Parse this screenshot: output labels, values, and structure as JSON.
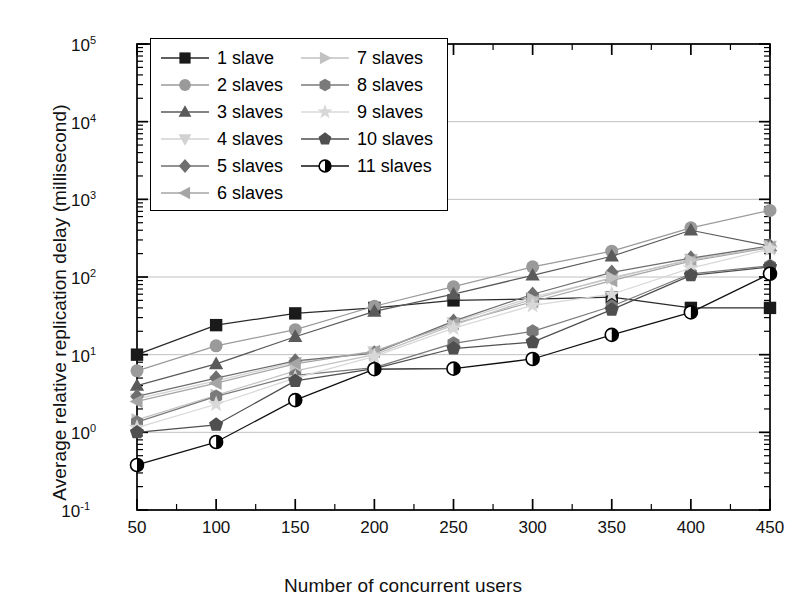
{
  "chart_data": {
    "type": "line",
    "title": "",
    "xlabel": "Number of concurrent users",
    "ylabel": "Average relative replication delay (millisecond)",
    "x": [
      50,
      100,
      150,
      200,
      250,
      300,
      350,
      400,
      450
    ],
    "xlim": [
      50,
      450
    ],
    "ylim": [
      0.1,
      100000
    ],
    "yscale": "log",
    "xticklabels": [
      "50",
      "100",
      "150",
      "200",
      "250",
      "300",
      "350",
      "400",
      "450"
    ],
    "yticklabels": [
      "10-1",
      "100",
      "101",
      "102",
      "103",
      "104",
      "105"
    ],
    "ytick_bases": [
      "10",
      "10",
      "10",
      "10",
      "10",
      "10",
      "10"
    ],
    "ytick_exps": [
      "-1",
      "0",
      "1",
      "2",
      "3",
      "4",
      "5"
    ],
    "grid": "horizontal-major",
    "legend_position": "upper-left-inside",
    "series": [
      {
        "name": "1 slave",
        "marker": "square",
        "color": "#1a1a1a",
        "values": [
          10.0,
          24.0,
          34.0,
          40.0,
          50.0,
          52.0,
          55.0,
          40.0,
          40.0
        ]
      },
      {
        "name": "2 slaves",
        "marker": "circle",
        "color": "#9a9a9a",
        "values": [
          6.2,
          13.0,
          21.0,
          42.0,
          75.0,
          135.0,
          215.0,
          430.0,
          720.0
        ]
      },
      {
        "name": "3 slaves",
        "marker": "triangle-up",
        "color": "#5a5a5a",
        "values": [
          4.0,
          7.6,
          17.0,
          36.0,
          60.0,
          105.0,
          185.0,
          400.0,
          250.0
        ]
      },
      {
        "name": "4 slaves",
        "marker": "triangle-down",
        "color": "#d2d2d2",
        "values": [
          2.7,
          4.6,
          8.0,
          11.0,
          26.0,
          55.0,
          95.0,
          170.0,
          250.0
        ]
      },
      {
        "name": "5 slaves",
        "marker": "diamond",
        "color": "#6e6e6e",
        "values": [
          2.9,
          5.0,
          8.3,
          10.5,
          27.0,
          60.0,
          115.0,
          175.0,
          250.0
        ]
      },
      {
        "name": "6 slaves",
        "marker": "triangle-left",
        "color": "#a5a5a5",
        "values": [
          2.5,
          4.3,
          7.6,
          11.0,
          25.0,
          48.0,
          90.0,
          160.0,
          240.0
        ]
      },
      {
        "name": "7 slaves",
        "marker": "triangle-right",
        "color": "#c2c2c2",
        "values": [
          1.45,
          3.0,
          6.2,
          10.0,
          24.0,
          52.0,
          98.0,
          165.0,
          245.0
        ]
      },
      {
        "name": "8 slaves",
        "marker": "hexagon",
        "color": "#7a7a7a",
        "values": [
          1.35,
          2.9,
          5.4,
          6.8,
          14.0,
          20.0,
          42.0,
          110.0,
          140.0
        ]
      },
      {
        "name": "9 slaves",
        "marker": "star",
        "color": "#d8d8d8",
        "values": [
          1.15,
          2.3,
          5.0,
          9.5,
          22.0,
          43.0,
          60.0,
          130.0,
          230.0
        ]
      },
      {
        "name": "10 slaves",
        "marker": "pentagon",
        "color": "#4f4f4f",
        "values": [
          1.0,
          1.25,
          4.6,
          6.6,
          12.0,
          14.5,
          38.0,
          105.0,
          135.0
        ]
      },
      {
        "name": "11 slaves",
        "marker": "circle-half",
        "color": "#101010",
        "values": [
          0.38,
          0.75,
          2.6,
          6.5,
          6.6,
          8.8,
          18.0,
          35.0,
          110.0
        ]
      }
    ],
    "legend_order": [
      "1 slave",
      "2 slaves",
      "3 slaves",
      "4 slaves",
      "5 slaves",
      "6 slaves",
      "7 slaves",
      "8 slaves",
      "9 slaves",
      "10 slaves",
      "11 slaves"
    ]
  },
  "colors": {
    "axis": "#000000",
    "grid": "#b9b9b9",
    "background": "#ffffff",
    "text": "#111111"
  }
}
